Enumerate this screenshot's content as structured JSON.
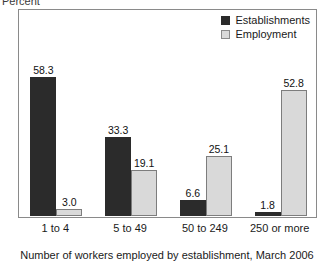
{
  "chart_data": {
    "type": "bar",
    "title": "",
    "xlabel": "Number of workers employed by establishment, March 2006",
    "ylabel": "Percent",
    "categories": [
      "1 to 4",
      "5 to 49",
      "50 to 249",
      "250 or more"
    ],
    "series": [
      {
        "name": "Establishments",
        "color": "#2b2b2b",
        "values": [
          58.3,
          33.3,
          6.6,
          1.8
        ]
      },
      {
        "name": "Employment",
        "color": "#d9d9d9",
        "values": [
          3.0,
          19.1,
          25.1,
          52.8
        ]
      }
    ],
    "value_labels": [
      [
        "58.3",
        "3.0"
      ],
      [
        "33.3",
        "19.1"
      ],
      [
        "6.6",
        "25.1"
      ],
      [
        "1.8",
        "52.8"
      ]
    ],
    "ylim": [
      0,
      63
    ],
    "grid": false,
    "yticks_visible": false,
    "legend_position": "top-right-inside"
  },
  "legend": {
    "items": [
      {
        "label": "Establishments",
        "style": "dark"
      },
      {
        "label": "Employment",
        "style": "light"
      }
    ]
  }
}
